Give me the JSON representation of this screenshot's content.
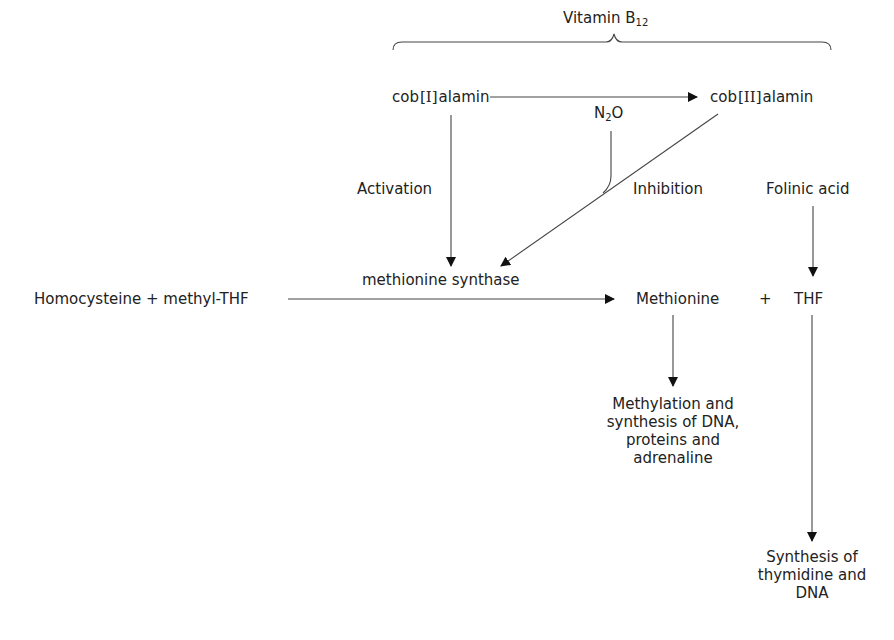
{
  "diagram": {
    "header": {
      "vitamin_main": "Vitamin B",
      "vitamin_sub": "12"
    },
    "nodes": {
      "cob1_prefix": "cob",
      "cob1_roman": "[I]",
      "cob1_suffix": "alamin",
      "cob2_prefix": "cob",
      "cob2_roman": "[II]",
      "cob2_suffix": "alamin",
      "n2o_main": "N",
      "n2o_sub": "2",
      "n2o_suffix": "O",
      "folinic_acid": "Folinic acid",
      "substrates": "Homocysteine + methyl-THF",
      "enzyme": "methionine synthase",
      "methionine": "Methionine",
      "plus": "+",
      "thf": "THF",
      "methylation_output": "Methylation and synthesis of DNA, proteins and adrenaline",
      "thymidine_output": "Synthesis of thymidine and DNA"
    },
    "edge_labels": {
      "activation": "Activation",
      "inhibition": "Inhibition"
    },
    "edges": [
      {
        "from": "cob[I]alamin",
        "to": "cob[II]alamin",
        "type": "conversion"
      },
      {
        "from": "cob[I]alamin",
        "to": "methionine synthase",
        "label": "Activation"
      },
      {
        "from": "cob[II]alamin",
        "to": "methionine synthase",
        "label": "Inhibition"
      },
      {
        "from": "N2O",
        "to": "cob[I]alamin→cob[II]alamin pathway",
        "type": "joins inhibition"
      },
      {
        "from": "Homocysteine + methyl-THF",
        "to": "Methionine + THF",
        "via": "methionine synthase"
      },
      {
        "from": "Folinic acid",
        "to": "THF"
      },
      {
        "from": "Methionine",
        "to": "Methylation and synthesis of DNA, proteins and adrenaline"
      },
      {
        "from": "THF",
        "to": "Synthesis of thymidine and DNA"
      }
    ],
    "colors": {
      "line": "#444444",
      "text": "#222222",
      "background": "#ffffff"
    }
  }
}
